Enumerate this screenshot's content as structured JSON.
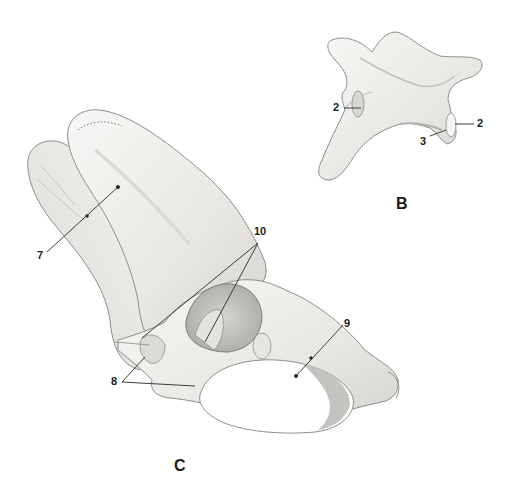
{
  "figure_b": {
    "letter": "B",
    "labels": [
      {
        "id": "b-2-left",
        "text": "2",
        "x": 333,
        "y": 102
      },
      {
        "id": "b-2-right",
        "text": "2",
        "x": 477,
        "y": 120
      },
      {
        "id": "b-3",
        "text": "3",
        "x": 419,
        "y": 140
      }
    ],
    "letter_pos": {
      "x": 396,
      "y": 197
    }
  },
  "figure_c": {
    "letter": "C",
    "labels": [
      {
        "id": "c-7",
        "text": "7",
        "x": 38,
        "y": 250
      },
      {
        "id": "c-10",
        "text": "10",
        "x": 255,
        "y": 226
      },
      {
        "id": "c-9",
        "text": "9",
        "x": 345,
        "y": 320
      },
      {
        "id": "c-8",
        "text": "8",
        "x": 112,
        "y": 377
      }
    ],
    "letter_pos": {
      "x": 175,
      "y": 458
    }
  },
  "colors": {
    "background": "#ffffff",
    "bone_fill": "#ecebe8",
    "bone_light": "#f6f6f4",
    "bone_shadow": "#c9c8c4",
    "bone_outline": "#8e8d89",
    "cavity": "#b8b7b3",
    "label_text": "#1a1a1a",
    "leader_line": "#2a2a2a"
  }
}
